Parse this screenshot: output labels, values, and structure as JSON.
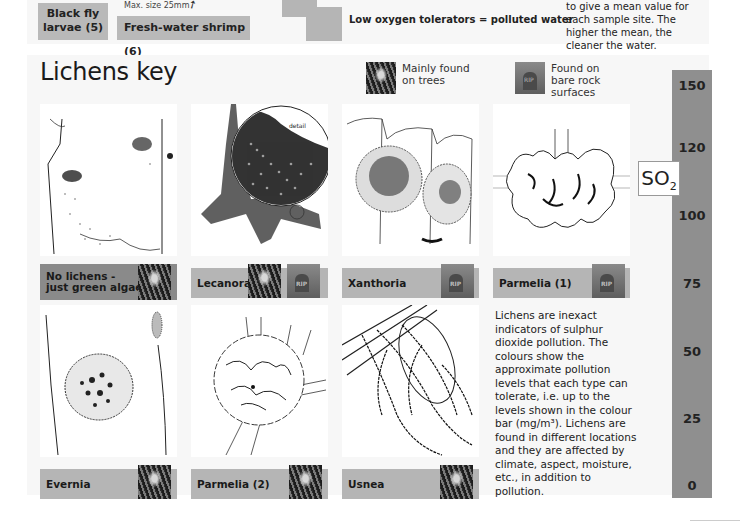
{
  "water_key": {
    "black_fly": "Black fly larvae (5)",
    "black_fly_line1": "Black fly",
    "black_fly_line2": "larvae (5)",
    "shrimp": "Fresh-water shrimp (6)",
    "max_size": "Max. size 25mm",
    "low_oxygen": "Low oxygen tolerators = polluted water",
    "mean_text": "to give a mean value for each sample site. The higher the mean, the cleaner the water."
  },
  "lichens": {
    "title": "Lichens key",
    "legend": [
      {
        "icon": "tree-bark-icon",
        "text": "Mainly found on trees"
      },
      {
        "icon": "gravestone-icon",
        "text": "Found on bare rock surfaces"
      }
    ],
    "cards": [
      {
        "name": "No lichens - just green algae",
        "line1": "No lichens -",
        "line2": "just green algae",
        "tone": "dark",
        "icons": [
          "tree-bark-icon"
        ]
      },
      {
        "name": "Lecanora",
        "tone": "light",
        "icons": [
          "tree-bark-icon",
          "gravestone-icon"
        ]
      },
      {
        "name": "Xanthoria",
        "tone": "light",
        "icons": [
          "gravestone-icon"
        ]
      },
      {
        "name": "Parmelia (1)",
        "tone": "light",
        "icons": [
          "gravestone-icon"
        ]
      },
      {
        "name": "Evernia",
        "tone": "light",
        "icons": [
          "tree-bark-icon"
        ]
      },
      {
        "name": "Parmelia (2)",
        "tone": "light",
        "icons": [
          "tree-bark-icon"
        ]
      },
      {
        "name": "Usnea",
        "tone": "light",
        "icons": [
          "tree-bark-icon"
        ]
      }
    ],
    "lecanora_detail_label": "detail",
    "info": "Lichens are inexact indicators of sulphur dioxide pollution. The colours show the approximate pollution levels that each type can tolerate, i.e. up to the levels shown in the colour bar (mg/m³). Lichens are found in different locations and they are affected by climate, aspect, moisture, etc., in addition to pollution."
  },
  "scale": {
    "label": "SO",
    "subscript": "2",
    "ticks": [
      "150",
      "120",
      "100",
      "75",
      "50",
      "25",
      "0"
    ],
    "bar_color": "#8f8f8f"
  }
}
